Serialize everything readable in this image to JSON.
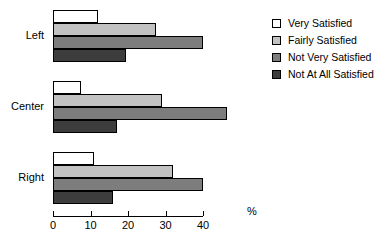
{
  "chart_data": {
    "type": "bar",
    "orientation": "horizontal",
    "title": "",
    "xlabel": "%",
    "ylabel": "",
    "xlim": [
      0,
      40
    ],
    "xticks": [
      0,
      10,
      20,
      30,
      40
    ],
    "xtick_labels": [
      "0",
      "10",
      "20",
      "30",
      "40"
    ],
    "grid": false,
    "legend_position": "right",
    "categories": [
      "Left",
      "Center",
      "Right"
    ],
    "series": [
      {
        "name": "Very Satisfied",
        "color": "#ffffff",
        "values": [
          12.0,
          7.5,
          11.0
        ]
      },
      {
        "name": "Fairly Satisfied",
        "color": "#c2c2c2",
        "values": [
          27.5,
          29.0,
          32.0
        ]
      },
      {
        "name": "Not Very Satisfied",
        "color": "#7d7d7d",
        "values": [
          40.0,
          46.5,
          40.0
        ]
      },
      {
        "name": "Not At All Satisfied",
        "color": "#3d3d3d",
        "values": [
          19.5,
          17.0,
          16.0
        ]
      }
    ]
  },
  "axis": {
    "unit_label": "%"
  },
  "legend": {
    "items": [
      {
        "label": "Very Satisfied"
      },
      {
        "label": "Fairly Satisfied"
      },
      {
        "label": "Not Very Satisfied"
      },
      {
        "label": "Not At All Satisfied"
      }
    ]
  }
}
